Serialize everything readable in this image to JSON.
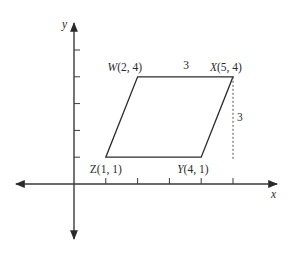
{
  "diagram": {
    "type": "coordinate-geometry",
    "axes": {
      "x_label": "x",
      "y_label": "y",
      "x_ticks": [
        1,
        2,
        3,
        4,
        5
      ],
      "y_ticks": [
        1,
        2,
        3,
        4,
        5
      ]
    },
    "vertices": [
      {
        "name": "W",
        "x": 2,
        "y": 4,
        "label": "W(2, 4)"
      },
      {
        "name": "X",
        "x": 5,
        "y": 4,
        "label": "X(5, 4)"
      },
      {
        "name": "Y",
        "x": 4,
        "y": 1,
        "label": "Y(4, 1)"
      },
      {
        "name": "Z",
        "x": 1,
        "y": 1,
        "label": "Z(1, 1)"
      }
    ],
    "measurements": {
      "top_side_length": "3",
      "height_label": "3"
    },
    "colors": {
      "line": "#2a2a2a",
      "background": "#ffffff"
    }
  }
}
